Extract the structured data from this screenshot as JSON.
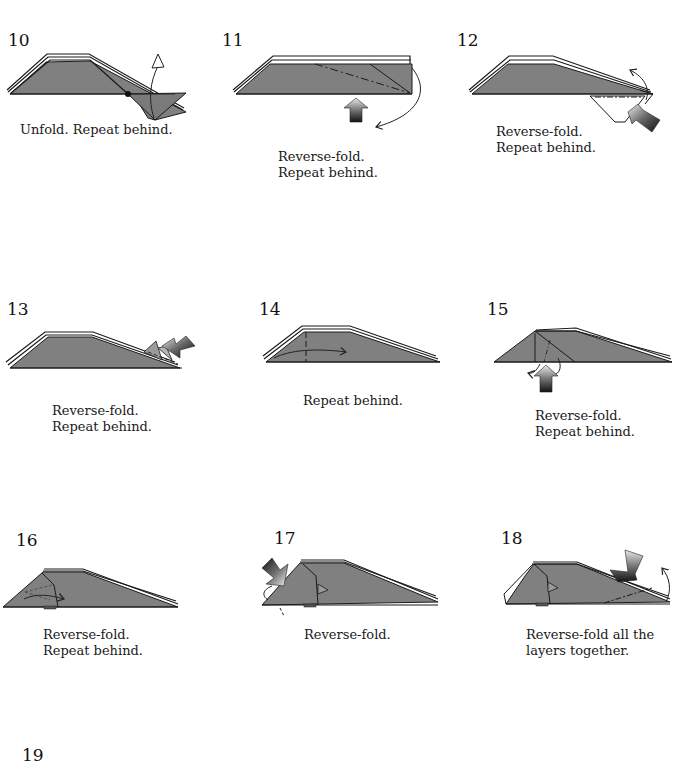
{
  "diagram": {
    "type": "origami folding instructions",
    "paper_color": "#808080",
    "outline_color": "#1a1a1a",
    "steps": [
      {
        "number": "10",
        "caption_lines": [
          "Unfold. Repeat behind."
        ]
      },
      {
        "number": "11",
        "caption_lines": [
          "Reverse-fold.",
          "Repeat behind."
        ]
      },
      {
        "number": "12",
        "caption_lines": [
          "Reverse-fold.",
          "Repeat behind."
        ]
      },
      {
        "number": "13",
        "caption_lines": [
          "Reverse-fold.",
          "Repeat behind."
        ]
      },
      {
        "number": "14",
        "caption_lines": [
          "Repeat behind."
        ]
      },
      {
        "number": "15",
        "caption_lines": [
          "Reverse-fold.",
          "Repeat behind."
        ]
      },
      {
        "number": "16",
        "caption_lines": [
          "Reverse-fold.",
          "Repeat behind."
        ]
      },
      {
        "number": "17",
        "caption_lines": [
          "Reverse-fold."
        ]
      },
      {
        "number": "18",
        "caption_lines": [
          "Reverse-fold all the",
          "layers together."
        ]
      },
      {
        "number": "19",
        "caption_lines": []
      }
    ]
  }
}
